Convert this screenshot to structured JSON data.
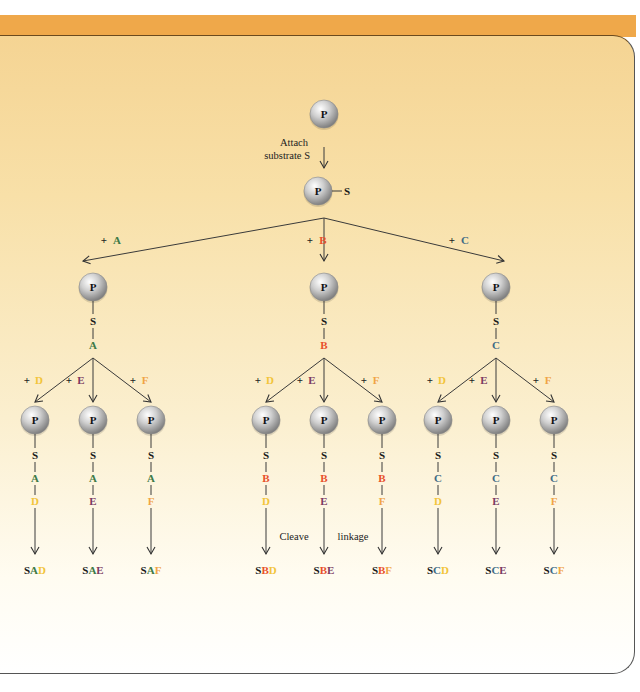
{
  "colors": {
    "header_bar": "#efa84a",
    "panel_top": "#f5d493",
    "panel_bottom": "#ffffff",
    "black": "#1a1a1a",
    "A": "#3d7a46",
    "B": "#e8502a",
    "C": "#3e6b86",
    "D": "#f2c43a",
    "E": "#7b3b62",
    "F": "#f0a445"
  },
  "diagram": {
    "root_bead": "P",
    "attach_label_line1": "Attach",
    "attach_label_line2": "substrate S",
    "substrate": "S",
    "first_additions": [
      {
        "plus": "+",
        "unit": "A"
      },
      {
        "plus": "+",
        "unit": "B"
      },
      {
        "plus": "+",
        "unit": "C"
      }
    ],
    "second_additions": [
      {
        "plus": "+",
        "unit": "D"
      },
      {
        "plus": "+",
        "unit": "E"
      },
      {
        "plus": "+",
        "unit": "F"
      }
    ],
    "cleave_label_left": "Cleave",
    "cleave_label_right": "linkage",
    "products": [
      {
        "s": "S",
        "first": "A",
        "second": "D"
      },
      {
        "s": "S",
        "first": "A",
        "second": "E"
      },
      {
        "s": "S",
        "first": "A",
        "second": "F"
      },
      {
        "s": "S",
        "first": "B",
        "second": "D"
      },
      {
        "s": "S",
        "first": "B",
        "second": "E"
      },
      {
        "s": "S",
        "first": "B",
        "second": "F"
      },
      {
        "s": "S",
        "first": "C",
        "second": "D"
      },
      {
        "s": "S",
        "first": "C",
        "second": "E"
      },
      {
        "s": "S",
        "first": "C",
        "second": "F"
      }
    ]
  }
}
